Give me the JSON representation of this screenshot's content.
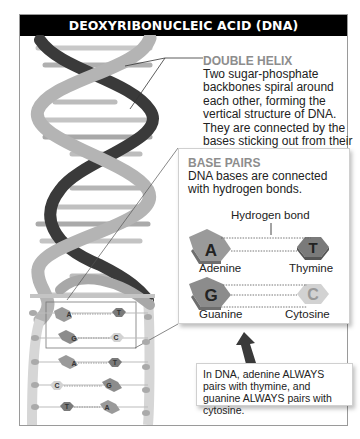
{
  "header": {
    "title": "DEOXYRIBONUCLEIC ACID (DNA)"
  },
  "double_helix": {
    "title": "DOUBLE HELIX",
    "body": "Two sugar-phosphate backbones spiral around each other, forming the vertical structure of DNA. They are connected by the bases sticking out from their sugar molecules."
  },
  "base_pairs": {
    "title": "BASE PAIRS",
    "body": "DNA bases are connected with hydrogen bonds.",
    "hydrogen_bond_label": "Hydrogen bond",
    "pairs": [
      {
        "left": {
          "letter": "A",
          "name": "Adenine",
          "color": "#9a9a9a"
        },
        "right": {
          "letter": "T",
          "name": "Thymine",
          "color": "#7a7a7a"
        }
      },
      {
        "left": {
          "letter": "G",
          "name": "Guanine",
          "color": "#8c8c8c"
        },
        "right": {
          "letter": "C",
          "name": "Cytosine",
          "color": "#d2d2d2"
        }
      }
    ]
  },
  "ladder": {
    "rungs": [
      {
        "left": "A",
        "right": "T"
      },
      {
        "left": "G",
        "right": "C"
      },
      {
        "left": "A",
        "right": "T"
      },
      {
        "left": "C",
        "right": "G"
      },
      {
        "left": "T",
        "right": "A"
      }
    ]
  },
  "note": {
    "text": "In DNA, adenine ALWAYS pairs with thymine, and guanine ALWAYS pairs with cytosine."
  },
  "colors": {
    "header_bg": "#000000",
    "header_text": "#ffffff",
    "backbone_light": "#b4b4b4",
    "backbone_dark": "#3a3a3a",
    "label_title": "#8d8d8d"
  }
}
